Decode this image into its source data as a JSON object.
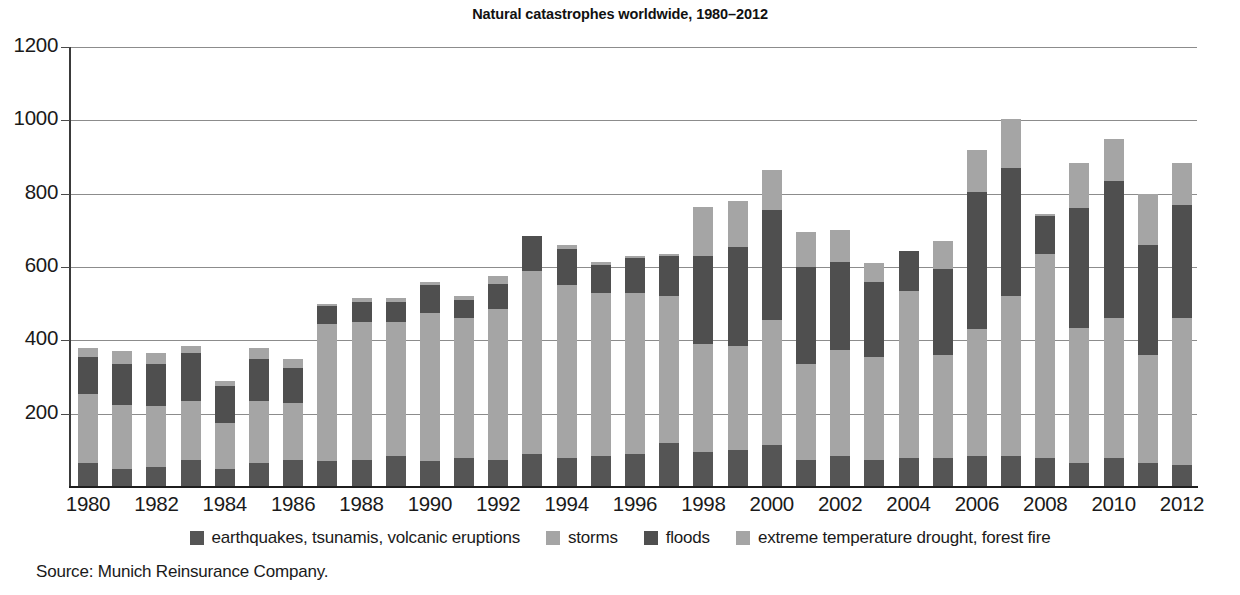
{
  "chart_data": {
    "type": "bar",
    "subtype": "stacked",
    "title": "Natural catastrophes worldwide, 1980–2012",
    "xlabel": "",
    "ylabel": "",
    "ylim": [
      0,
      1200
    ],
    "ytick_step": 200,
    "yticks": [
      200,
      400,
      600,
      800,
      1000,
      1200
    ],
    "grid": true,
    "legend_position": "bottom",
    "source": "Source: Munich Reinsurance Company.",
    "x": [
      1980,
      1981,
      1982,
      1983,
      1984,
      1985,
      1986,
      1987,
      1988,
      1989,
      1990,
      1991,
      1992,
      1993,
      1994,
      1995,
      1996,
      1997,
      1998,
      1999,
      2000,
      2001,
      2002,
      2003,
      2004,
      2005,
      2006,
      2007,
      2008,
      2009,
      2010,
      2011,
      2012
    ],
    "xtick_labels": [
      "1980",
      "1982",
      "1984",
      "1986",
      "1988",
      "1990",
      "1992",
      "1994",
      "1996",
      "1998",
      "2000",
      "2002",
      "2004",
      "2006",
      "2008",
      "2010",
      "2012"
    ],
    "series": [
      {
        "name": "earthquakes, tsunamis, volcanic eruptions",
        "color": "#555555",
        "values": [
          65,
          50,
          55,
          75,
          50,
          65,
          75,
          70,
          75,
          85,
          70,
          80,
          75,
          90,
          80,
          85,
          90,
          120,
          95,
          100,
          115,
          75,
          85,
          75,
          80,
          80,
          85,
          85,
          80,
          65,
          80,
          65,
          60
        ]
      },
      {
        "name": "storms",
        "color": "#a5a5a5",
        "values": [
          190,
          175,
          165,
          160,
          125,
          170,
          155,
          375,
          375,
          365,
          405,
          380,
          410,
          500,
          470,
          445,
          440,
          400,
          295,
          285,
          340,
          260,
          290,
          280,
          455,
          280,
          345,
          435,
          555,
          370,
          380,
          295,
          400
        ]
      },
      {
        "name": "floods",
        "color": "#4f4f4f",
        "values": [
          100,
          110,
          115,
          130,
          100,
          115,
          95,
          50,
          55,
          55,
          75,
          50,
          70,
          95,
          100,
          75,
          95,
          110,
          240,
          270,
          300,
          265,
          240,
          205,
          110,
          235,
          375,
          350,
          105,
          325,
          375,
          300,
          310
        ]
      },
      {
        "name": "extreme temperature drought, forest fire",
        "color": "#a5a5a5",
        "values": [
          25,
          35,
          30,
          20,
          15,
          30,
          25,
          5,
          10,
          10,
          10,
          10,
          20,
          0,
          10,
          10,
          5,
          5,
          135,
          125,
          110,
          95,
          85,
          50,
          0,
          75,
          115,
          135,
          5,
          125,
          115,
          140,
          115
        ]
      }
    ]
  }
}
